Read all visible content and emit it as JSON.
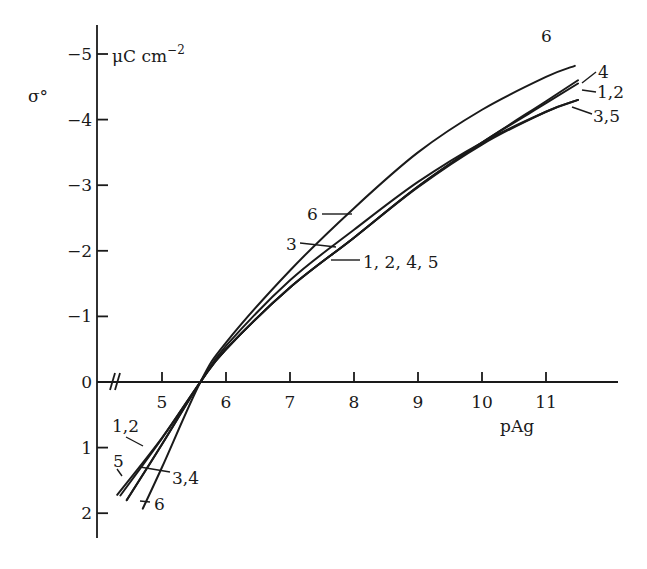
{
  "chart_data": {
    "type": "line",
    "title": "",
    "xlabel": "pAg",
    "ylabel": "σ°",
    "yunit": "μC cm⁻²",
    "xlim": [
      4.0,
      12.1
    ],
    "ylim": [
      2.3,
      -5.5
    ],
    "y_axis_inverted": true,
    "x_axis_break": true,
    "grid": false,
    "legend": "inline curve labels",
    "x_ticks": [
      5,
      6,
      7,
      8,
      9,
      10,
      11
    ],
    "x_tick_labels": [
      "5",
      "6",
      "7",
      "8",
      "9",
      "10",
      "11"
    ],
    "y_ticks": [
      -5,
      -4,
      -3,
      -2,
      -1,
      0,
      1,
      2
    ],
    "y_tick_labels": [
      "-5",
      "-4",
      "-3",
      "-2",
      "-1",
      "0",
      "1",
      "2"
    ],
    "series": [
      {
        "name": "1,2",
        "x": [
          4.3,
          5.0,
          5.6,
          6.0,
          7.0,
          8.0,
          9.0,
          10.0,
          11.0,
          11.5
        ],
        "values": [
          1.72,
          0.85,
          0.0,
          -0.5,
          -1.44,
          -2.2,
          -2.98,
          -3.65,
          -4.25,
          -4.55
        ]
      },
      {
        "name": "4",
        "x": [
          4.45,
          5.0,
          5.6,
          6.0,
          7.0,
          8.0,
          9.0,
          10.0,
          11.0,
          11.5
        ],
        "values": [
          1.8,
          0.95,
          0.0,
          -0.5,
          -1.44,
          -2.2,
          -2.98,
          -3.65,
          -4.28,
          -4.6
        ]
      },
      {
        "name": "5",
        "x": [
          4.35,
          5.0,
          5.6,
          6.0,
          7.0,
          8.0,
          9.0,
          10.0,
          11.0,
          11.5
        ],
        "values": [
          1.73,
          0.86,
          0.0,
          -0.5,
          -1.44,
          -2.2,
          -2.97,
          -3.62,
          -4.12,
          -4.3
        ]
      },
      {
        "name": "3",
        "x": [
          4.45,
          5.0,
          5.6,
          6.0,
          7.0,
          8.0,
          9.0,
          10.0,
          11.0,
          11.5
        ],
        "values": [
          1.8,
          0.95,
          0.0,
          -0.55,
          -1.55,
          -2.32,
          -3.05,
          -3.65,
          -4.12,
          -4.3
        ]
      },
      {
        "name": "6",
        "x": [
          4.7,
          5.0,
          5.6,
          6.0,
          7.0,
          8.0,
          9.0,
          10.0,
          11.0,
          11.45
        ],
        "values": [
          1.93,
          1.3,
          0.0,
          -0.6,
          -1.7,
          -2.65,
          -3.5,
          -4.15,
          -4.65,
          -4.82
        ]
      }
    ],
    "annotations": [
      {
        "text": "6",
        "near": "top-right end of curve 6"
      },
      {
        "text": "4",
        "near": "top-right end of curve 4"
      },
      {
        "text": "1,2",
        "near": "top-right end of curves 1,2"
      },
      {
        "text": "3,5",
        "near": "top-right end of curves 3,5"
      },
      {
        "text": "6",
        "near": "curve 6 at pAg ≈ 7.7"
      },
      {
        "text": "3",
        "near": "curve 3 at pAg ≈ 7.6"
      },
      {
        "text": "1, 2, 4, 5",
        "near": "curves 1,2,4,5 at pAg ≈ 7.9"
      },
      {
        "text": "1,2",
        "near": "lower-left curves 1,2"
      },
      {
        "text": "5",
        "near": "lower-left curve 5"
      },
      {
        "text": "3,4",
        "near": "lower-left curves 3,4"
      },
      {
        "text": "6",
        "near": "lower-left curve 6"
      }
    ]
  },
  "labels": {
    "ylabel": "σ°",
    "yunit": "μC cm",
    "yunit_exp": "−2",
    "xlabel": "pAg",
    "top_right": [
      {
        "text": "6",
        "x": 541,
        "y": 42
      },
      {
        "text": "4",
        "x": 598,
        "y": 78
      },
      {
        "text": "1,2",
        "x": 597,
        "y": 98
      },
      {
        "text": "3,5",
        "x": 593,
        "y": 122
      }
    ],
    "middle": [
      {
        "text": "6",
        "x": 307,
        "y": 220
      },
      {
        "text": "3",
        "x": 286,
        "y": 250
      },
      {
        "text": "1, 2, 4, 5",
        "x": 363,
        "y": 268
      }
    ],
    "bottom_left": [
      {
        "text": "1,2",
        "x": 112,
        "y": 432
      },
      {
        "text": "5",
        "x": 113,
        "y": 467
      },
      {
        "text": "3,4",
        "x": 172,
        "y": 484
      },
      {
        "text": "6",
        "x": 154,
        "y": 510
      }
    ]
  }
}
